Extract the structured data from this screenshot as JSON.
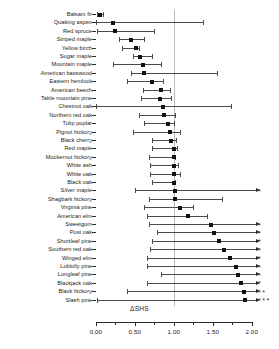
{
  "chart_data": {
    "type": "scatter",
    "title": "",
    "subtitle": "",
    "xlabel": "ΔSHS",
    "ylabel": "",
    "xlim": [
      -0.05,
      2.35
    ],
    "xticks": [
      0.0,
      0.25,
      0.5,
      0.75,
      1.0,
      1.25,
      1.5,
      1.75,
      2.0
    ],
    "xticklabels": [
      "0.00",
      "",
      "0.50",
      "",
      "1.00",
      "",
      "1.50",
      "",
      "2.00"
    ],
    "reference_line": 1.0,
    "grid": false,
    "legend": null,
    "orientation": "horizontal",
    "error_bar_type": "confidence-interval",
    "significance_marker": "*",
    "categories": [
      "Balsam fir",
      "Quaking aspen",
      "Red spruce",
      "Striped maple",
      "Yellow birch",
      "Sugar maple",
      "Mountain maple",
      "American basswood",
      "Eastern hemlock",
      "American beech",
      "Table mountain pine",
      "Chestnut oak",
      "Northern red oak",
      "Tulip poplar",
      "Pignut hickory",
      "Black cherry",
      "Red maple",
      "Mockernut hickory",
      "White ash",
      "White oak",
      "Black oak",
      "Silver maple",
      "Shagbark hickory",
      "Virginia pine",
      "American elm",
      "Sweetgum",
      "Post oak",
      "Shortleaf pine",
      "Southern red oak",
      "Winged elm",
      "Loblolly pine",
      "Longleaf pine",
      "Blackjack oak",
      "Black hickory",
      "Slash pine"
    ],
    "points": [
      {
        "label": "Balsam fir",
        "value": 0.05,
        "low": 0.02,
        "high": 0.09,
        "stars": 0
      },
      {
        "label": "Quaking aspen",
        "value": 0.22,
        "low": 0.0,
        "high": 1.38,
        "stars": 0
      },
      {
        "label": "Red spruce",
        "value": 0.25,
        "low": 0.02,
        "high": 0.75,
        "stars": 0
      },
      {
        "label": "Striped maple",
        "value": 0.45,
        "low": 0.3,
        "high": 0.62,
        "stars": 0
      },
      {
        "label": "Yellow birch",
        "value": 0.52,
        "low": 0.33,
        "high": 0.55,
        "stars": 0
      },
      {
        "label": "Sugar maple",
        "value": 0.57,
        "low": 0.48,
        "high": 0.72,
        "stars": 0
      },
      {
        "label": "Mountain maple",
        "value": 0.6,
        "low": 0.22,
        "high": 0.83,
        "stars": 0
      },
      {
        "label": "American basswood",
        "value": 0.62,
        "low": 0.45,
        "high": 1.55,
        "stars": 0
      },
      {
        "label": "Eastern hemlock",
        "value": 0.72,
        "low": 0.4,
        "high": 0.86,
        "stars": 0
      },
      {
        "label": "American beech",
        "value": 0.83,
        "low": 0.6,
        "high": 0.95,
        "stars": 0
      },
      {
        "label": "Table mountain pine",
        "value": 0.82,
        "low": 0.58,
        "high": 0.97,
        "stars": 0
      },
      {
        "label": "Chestnut oak",
        "value": 0.86,
        "low": 0.0,
        "high": 1.73,
        "stars": 0
      },
      {
        "label": "Northern red oak",
        "value": 0.88,
        "low": 0.55,
        "high": 1.02,
        "stars": 0
      },
      {
        "label": "Tulip poplar",
        "value": 0.93,
        "low": 0.62,
        "high": 1.0,
        "stars": 0
      },
      {
        "label": "Pignut hickory",
        "value": 0.95,
        "low": 0.48,
        "high": 1.08,
        "stars": 0
      },
      {
        "label": "Black cherry",
        "value": 0.97,
        "low": 0.72,
        "high": 1.03,
        "stars": 0
      },
      {
        "label": "Red maple",
        "value": 1.0,
        "low": 0.72,
        "high": 1.04,
        "stars": 0
      },
      {
        "label": "Mockernut hickory",
        "value": 1.0,
        "low": 0.68,
        "high": 1.02,
        "stars": 0
      },
      {
        "label": "White ash",
        "value": 1.0,
        "low": 0.7,
        "high": 1.05,
        "stars": 0
      },
      {
        "label": "White oak",
        "value": 1.0,
        "low": 0.7,
        "high": 1.08,
        "stars": 0
      },
      {
        "label": "Black oak",
        "value": 1.0,
        "low": 0.72,
        "high": 1.02,
        "stars": 0
      },
      {
        "label": "Silver maple",
        "value": 1.02,
        "low": 0.5,
        "high": 2.05,
        "stars": 1
      },
      {
        "label": "Shagbark hickory",
        "value": 1.02,
        "low": 0.68,
        "high": 1.62,
        "stars": 0
      },
      {
        "label": "Virginia pine",
        "value": 1.08,
        "low": 0.62,
        "high": 1.25,
        "stars": 0
      },
      {
        "label": "American elm",
        "value": 1.18,
        "low": 0.65,
        "high": 1.42,
        "stars": 0
      },
      {
        "label": "Sweetgum",
        "value": 1.48,
        "low": 0.68,
        "high": 2.05,
        "stars": 1
      },
      {
        "label": "Post oak",
        "value": 1.52,
        "low": 0.78,
        "high": 2.05,
        "stars": 1
      },
      {
        "label": "Shortleaf pine",
        "value": 1.58,
        "low": 0.72,
        "high": 2.05,
        "stars": 1
      },
      {
        "label": "Southern red oak",
        "value": 1.65,
        "low": 0.7,
        "high": 2.05,
        "stars": 1
      },
      {
        "label": "Winged elm",
        "value": 1.72,
        "low": 0.66,
        "high": 2.05,
        "stars": 1
      },
      {
        "label": "Loblolly pine",
        "value": 1.8,
        "low": 0.66,
        "high": 2.05,
        "stars": 1
      },
      {
        "label": "Longleaf pine",
        "value": 1.83,
        "low": 0.83,
        "high": 2.05,
        "stars": 1
      },
      {
        "label": "Blackjack oak",
        "value": 1.86,
        "low": 0.66,
        "high": 2.05,
        "stars": 1
      },
      {
        "label": "Black hickory",
        "value": 1.9,
        "low": 0.4,
        "high": 2.05,
        "stars": 2
      },
      {
        "label": "Slash pine",
        "value": 1.92,
        "low": 0.02,
        "high": 2.05,
        "stars": 3
      }
    ]
  }
}
